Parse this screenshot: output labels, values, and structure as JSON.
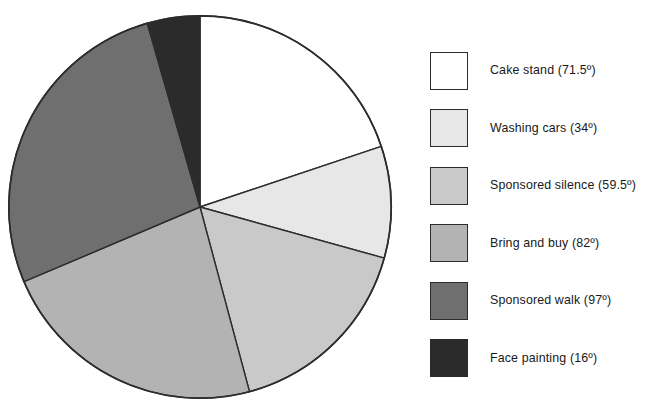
{
  "chart_data": {
    "type": "pie",
    "title": "",
    "subtitle": "",
    "xlabel": "",
    "ylabel": "",
    "units": "degrees",
    "total_degrees": 360,
    "start_angle_deg": 0,
    "direction": "clockwise",
    "legend_position": "right",
    "grid": false,
    "categories": [
      "Cake stand",
      "Washing cars",
      "Sponsored silence",
      "Bring and buy",
      "Sponsored walk",
      "Face painting"
    ],
    "values": [
      71.5,
      34,
      59.5,
      82,
      97,
      16
    ],
    "labels": [
      "Cake stand (71.5º)",
      "Washing cars (34º)",
      "Sponsored silence (59.5º)",
      "Bring and buy (82º)",
      "Sponsored walk (97º)",
      "Face painting (16º)"
    ],
    "colors": [
      "#ffffff",
      "#e7e7e7",
      "#c9c9c9",
      "#b3b3b3",
      "#6f6f6f",
      "#2b2b2b"
    ],
    "slice_edge_color": "#2c2c2c",
    "slices": [
      {
        "name": "Cake stand",
        "value": 71.5,
        "label": "Cake stand (71.5º)",
        "color": "#ffffff",
        "start_deg": 0,
        "end_deg": 71.5
      },
      {
        "name": "Washing cars",
        "value": 34,
        "label": "Washing cars (34º)",
        "color": "#e7e7e7",
        "start_deg": 71.5,
        "end_deg": 105.5
      },
      {
        "name": "Sponsored silence",
        "value": 59.5,
        "label": "Sponsored silence (59.5º)",
        "color": "#c9c9c9",
        "start_deg": 105.5,
        "end_deg": 165
      },
      {
        "name": "Bring and buy",
        "value": 82,
        "label": "Bring and buy (82º)",
        "color": "#b3b3b3",
        "start_deg": 165,
        "end_deg": 247
      },
      {
        "name": "Sponsored walk",
        "value": 97,
        "label": "Sponsored walk (97º)",
        "color": "#6f6f6f",
        "start_deg": 247,
        "end_deg": 344
      },
      {
        "name": "Face painting",
        "value": 16,
        "label": "Face painting (16º)",
        "color": "#2b2b2b",
        "start_deg": 344,
        "end_deg": 360
      }
    ]
  },
  "legend": {
    "items": [
      {
        "label": "Cake stand (71.5º)",
        "color": "#ffffff"
      },
      {
        "label": "Washing cars (34º)",
        "color": "#e7e7e7"
      },
      {
        "label": "Sponsored silence (59.5º)",
        "color": "#c9c9c9"
      },
      {
        "label": "Bring and buy (82º)",
        "color": "#b3b3b3"
      },
      {
        "label": "Sponsored walk (97º)",
        "color": "#6f6f6f"
      },
      {
        "label": "Face painting (16º)",
        "color": "#2b2b2b"
      }
    ]
  }
}
